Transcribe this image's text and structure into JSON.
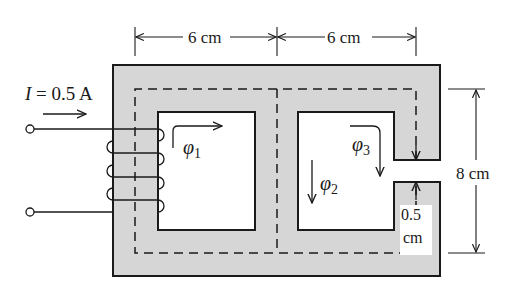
{
  "diagram": {
    "type": "magnetic-circuit",
    "colors": {
      "core_fill": "#d6d6d6",
      "stroke": "#1a1a1a",
      "background": "#ffffff"
    },
    "dimensions": {
      "top_left": "6 cm",
      "top_right": "6 cm",
      "height": "8 cm",
      "gap_value": "0.5",
      "gap_unit": "cm"
    },
    "current": {
      "symbol": "I",
      "equals": " = 0.5 A"
    },
    "fluxes": {
      "phi1": {
        "symbol": "φ",
        "subscript": "1"
      },
      "phi2": {
        "symbol": "φ",
        "subscript": "2"
      },
      "phi3": {
        "symbol": "φ",
        "subscript": "3"
      }
    }
  }
}
